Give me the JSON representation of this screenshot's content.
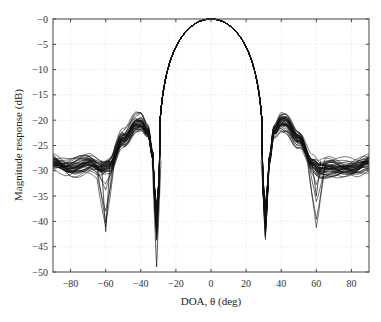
{
  "chart_data": {
    "type": "line",
    "title": "",
    "xlabel": "DOA, θ  (deg)",
    "ylabel": "Magnitude response (dB)",
    "xlim": [
      -90,
      90
    ],
    "ylim": [
      -50,
      0
    ],
    "xticks": [
      -80,
      -60,
      -40,
      -20,
      0,
      20,
      40,
      60,
      80
    ],
    "yticks": [
      0,
      -5,
      -10,
      -15,
      -20,
      -25,
      -30,
      -35,
      -40,
      -45,
      -50
    ],
    "xtick_labels": [
      "−80",
      "−60",
      "−40",
      "−20",
      "0",
      "20",
      "40",
      "60",
      "80"
    ],
    "ytick_labels": [
      "−0",
      "−5",
      "−10",
      "−15",
      "−20",
      "−25",
      "−30",
      "−35",
      "−40",
      "−45",
      "−50"
    ],
    "grid": true,
    "legend": "none",
    "num_curves": 40,
    "line_color": "#111111",
    "nominal_curve": {
      "x": [
        -90,
        -80,
        -70,
        -62,
        -58,
        -50,
        -42,
        -40,
        -36,
        -33,
        -31.5,
        -30,
        -25,
        -15,
        -5,
        0,
        5,
        15,
        25,
        30,
        31,
        33,
        36,
        40,
        42,
        50,
        58,
        62,
        70,
        80,
        90
      ],
      "y": [
        -28,
        -29,
        -28.5,
        -30,
        -29.5,
        -24,
        -20.5,
        -20.3,
        -22,
        -27,
        -36,
        -30,
        -16,
        -5,
        -0.5,
        0,
        -0.5,
        -5,
        -16,
        -27,
        -36,
        -28,
        -22,
        -20.3,
        -20.5,
        -24,
        -29,
        -30,
        -29.5,
        -29,
        -28
      ]
    },
    "deep_null_curves": [
      {
        "x_null": -31,
        "depth": -49
      },
      {
        "x_null": 31,
        "depth": -40
      },
      {
        "x_null": -60,
        "depth": -42
      },
      {
        "x_null": 60,
        "depth": -35
      }
    ],
    "spread_db": 4
  }
}
